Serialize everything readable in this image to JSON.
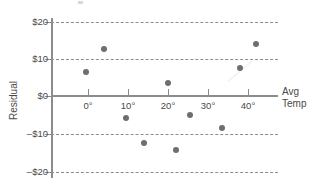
{
  "chart_data": {
    "type": "scatter",
    "title": "",
    "subtitle": "",
    "xlabel": "Avg Temp",
    "ylabel": "Residual",
    "xlabel_line1": "Avg",
    "xlabel_line2": "Temp",
    "grid": "horizontal-dashed",
    "legend": "none",
    "xlim": [
      -9,
      48
    ],
    "ylim": [
      -21,
      21
    ],
    "x_ticks": [
      0,
      10,
      20,
      30,
      40
    ],
    "x_tick_labels": [
      "0°",
      "10°",
      "20°",
      "30°",
      "40°"
    ],
    "y_ticks": [
      20,
      10,
      0,
      -10,
      -20
    ],
    "y_tick_labels": [
      "$20",
      "$10",
      "$0",
      "–$10",
      "–$20"
    ],
    "x": [
      -0.5,
      4,
      9.5,
      14,
      20,
      22,
      25.5,
      33.5,
      38,
      42
    ],
    "y": [
      6.3,
      12.5,
      -6,
      -12.5,
      3.5,
      -14.5,
      -5,
      -8.5,
      7.5,
      14
    ],
    "points": [
      {
        "x": -0.5,
        "y": 6.3
      },
      {
        "x": 4,
        "y": 12.5
      },
      {
        "x": 9.5,
        "y": -6
      },
      {
        "x": 14,
        "y": -12.5
      },
      {
        "x": 20,
        "y": 3.5
      },
      {
        "x": 22,
        "y": -14.5
      },
      {
        "x": 25.5,
        "y": -5
      },
      {
        "x": 33.5,
        "y": -8.5
      },
      {
        "x": 38,
        "y": 7.5
      },
      {
        "x": 42,
        "y": 14
      }
    ],
    "point_color": "#6e6e6e",
    "axis_color": "#8c8c8c",
    "text_color": "#4a4a4a",
    "background": "#ffffff"
  },
  "axes": {
    "y_title": "Residual",
    "x_title_line1": "Avg",
    "x_title_line2": "Temp",
    "y_labels": [
      "$20",
      "$10",
      "$0",
      "–$10",
      "–$20"
    ],
    "x_labels": [
      "0°",
      "10°",
      "20°",
      "30°",
      "40°"
    ]
  }
}
